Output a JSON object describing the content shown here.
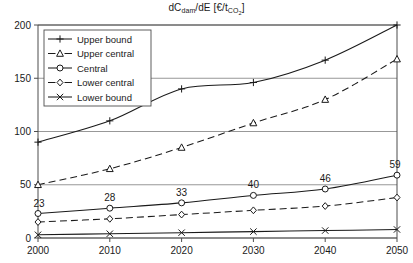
{
  "chart_data": {
    "type": "line",
    "title": "dCdam/dE [€/tCO2]",
    "title_main": "dC",
    "title_sub1": "dam",
    "title_mid": "/dE [€/t",
    "title_sub2": "CO",
    "title_sub3": "2",
    "title_end": "]",
    "xlabel": "",
    "ylabel": "",
    "x": [
      2000,
      2010,
      2020,
      2030,
      2040,
      2050
    ],
    "xticklabels": [
      "2000",
      "2010",
      "2020",
      "2030",
      "2040",
      "2050"
    ],
    "yticklabels": [
      "0",
      "50",
      "100",
      "150",
      "200"
    ],
    "yticks": [
      0,
      50,
      100,
      150,
      200
    ],
    "xlim": [
      2000,
      2050
    ],
    "ylim": [
      0,
      200
    ],
    "grid": true,
    "legend_position": "upper-left",
    "series": [
      {
        "name": "Upper bound",
        "marker": "plus",
        "dash": "solid",
        "values": [
          90,
          110,
          140,
          146,
          167,
          200
        ]
      },
      {
        "name": "Upper central",
        "marker": "triangle",
        "dash": "dashed",
        "values": [
          50,
          65,
          85,
          108,
          130,
          168
        ]
      },
      {
        "name": "Central",
        "marker": "circle",
        "dash": "solid",
        "values": [
          23,
          28,
          33,
          40,
          46,
          59
        ],
        "data_labels": [
          "23",
          "28",
          "33",
          "40",
          "46",
          "59"
        ]
      },
      {
        "name": "Lower central",
        "marker": "diamond",
        "dash": "dashed",
        "values": [
          15,
          18,
          22,
          26,
          30,
          38
        ]
      },
      {
        "name": "Lower bound",
        "marker": "cross",
        "dash": "solid",
        "values": [
          3,
          4,
          5,
          6,
          7,
          8
        ]
      }
    ],
    "colors": {
      "line": "#1a1a1a",
      "grid": "#8c8c8c",
      "axis": "#4d4d4d",
      "background": "#ffffff"
    }
  }
}
